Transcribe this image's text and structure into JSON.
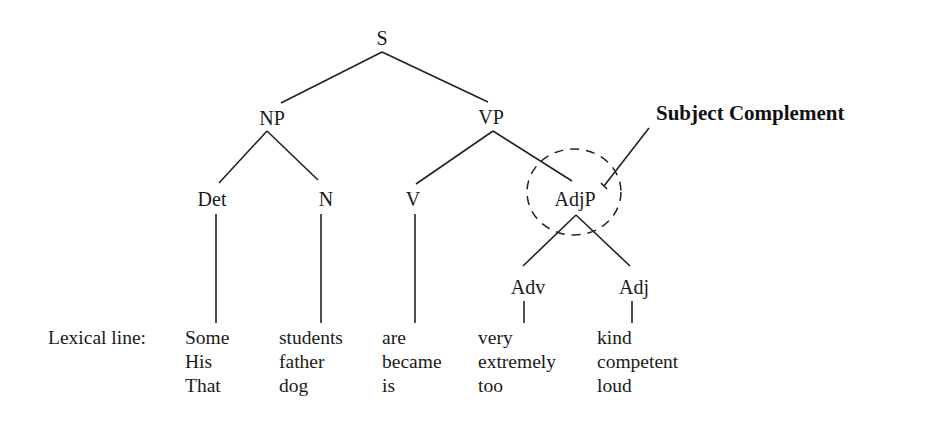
{
  "diagram": {
    "nodes": {
      "S": "S",
      "NP": "NP",
      "VP": "VP",
      "Det": "Det",
      "N": "N",
      "V": "V",
      "AdjP": "AdjP",
      "Adv": "Adv",
      "Adj": "Adj"
    },
    "callout": "Subject Complement",
    "lexical": {
      "label": "Lexical line:",
      "columns": [
        {
          "category": "Det",
          "words": [
            "Some",
            "His",
            "That"
          ]
        },
        {
          "category": "N",
          "words": [
            "students",
            "father",
            "dog"
          ]
        },
        {
          "category": "V",
          "words": [
            "are",
            "became",
            "is"
          ]
        },
        {
          "category": "Adv",
          "words": [
            "very",
            "extremely",
            "too"
          ]
        },
        {
          "category": "Adj",
          "words": [
            "kind",
            "competent",
            "loud"
          ]
        }
      ]
    }
  }
}
